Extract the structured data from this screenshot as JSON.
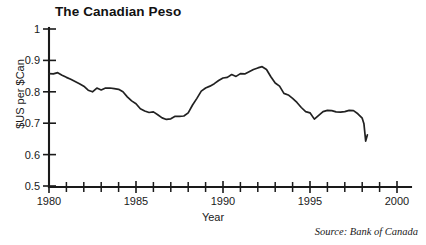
{
  "figure": {
    "title": "The Canadian Peso",
    "source_note": "Source: Bank of Canada"
  },
  "chart_data": {
    "type": "line",
    "title": "The Canadian Peso",
    "xlabel": "Year",
    "ylabel": "$US per $Can",
    "xlim": [
      1980,
      2000
    ],
    "ylim": [
      0.5,
      1.0
    ],
    "grid": false,
    "legend": null,
    "annotations": [
      "Source: Bank of Canada"
    ],
    "x_tick_labels": [
      "1980",
      "1985",
      "1990",
      "1995",
      "2000"
    ],
    "x_tick_values": [
      1980,
      1985,
      1990,
      1995,
      2000
    ],
    "x_minor_tick_interval": 1,
    "y_tick_labels": [
      "0.5",
      "0.6",
      "0.7",
      "0.8",
      "0.9",
      "1"
    ],
    "y_tick_values": [
      0.5,
      0.6,
      0.7,
      0.8,
      0.9,
      1.0
    ],
    "series": [
      {
        "name": "$US per $Can exchange rate",
        "x": [
          1980.0,
          1980.25,
          1980.5,
          1980.75,
          1981.0,
          1981.25,
          1981.5,
          1981.75,
          1982.0,
          1982.25,
          1982.5,
          1982.75,
          1983.0,
          1983.25,
          1983.5,
          1983.75,
          1984.0,
          1984.25,
          1984.5,
          1984.75,
          1985.0,
          1985.25,
          1985.5,
          1985.75,
          1986.0,
          1986.25,
          1986.5,
          1986.75,
          1987.0,
          1987.25,
          1987.5,
          1987.75,
          1988.0,
          1988.25,
          1988.5,
          1988.75,
          1989.0,
          1989.25,
          1989.5,
          1989.75,
          1990.0,
          1990.25,
          1990.5,
          1990.75,
          1991.0,
          1991.25,
          1991.5,
          1991.75,
          1992.0,
          1992.25,
          1992.5,
          1992.75,
          1993.0,
          1993.25,
          1993.5,
          1993.75,
          1994.0,
          1994.25,
          1994.5,
          1994.75,
          1995.0,
          1995.25,
          1995.5,
          1995.75,
          1996.0,
          1996.25,
          1996.5,
          1996.75,
          1997.0,
          1997.25,
          1997.5,
          1997.75,
          1998.0,
          1998.1,
          1998.2,
          1998.3
        ],
        "y": [
          0.858,
          0.857,
          0.861,
          0.853,
          0.846,
          0.84,
          0.833,
          0.826,
          0.818,
          0.805,
          0.8,
          0.812,
          0.806,
          0.812,
          0.812,
          0.81,
          0.808,
          0.8,
          0.784,
          0.771,
          0.762,
          0.746,
          0.739,
          0.734,
          0.736,
          0.727,
          0.717,
          0.712,
          0.714,
          0.722,
          0.722,
          0.723,
          0.733,
          0.758,
          0.779,
          0.802,
          0.812,
          0.818,
          0.826,
          0.836,
          0.844,
          0.846,
          0.855,
          0.849,
          0.858,
          0.857,
          0.864,
          0.871,
          0.876,
          0.88,
          0.871,
          0.848,
          0.828,
          0.818,
          0.795,
          0.79,
          0.779,
          0.766,
          0.75,
          0.737,
          0.733,
          0.713,
          0.725,
          0.737,
          0.741,
          0.74,
          0.736,
          0.735,
          0.737,
          0.741,
          0.74,
          0.73,
          0.716,
          0.698,
          0.643,
          0.663
        ]
      }
    ]
  }
}
